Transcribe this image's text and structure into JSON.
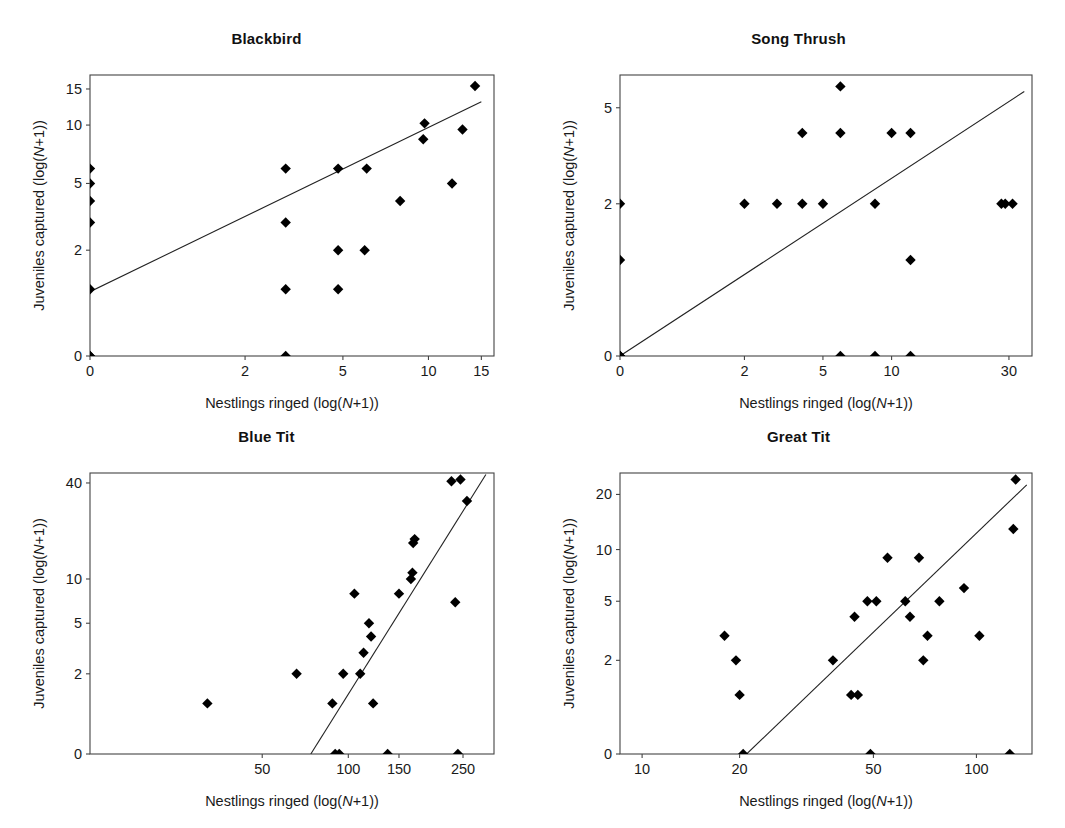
{
  "figure": {
    "background": "#ffffff",
    "marker_color": "#000000",
    "line_color": "#222222",
    "axis_color": "#444444",
    "panel_count": 4
  },
  "axis_labels": {
    "x_prefix": "Nestlings ringed (log(",
    "x_italic": "N",
    "x_suffix": "+1))",
    "y_prefix": "Juveniles captured (log(",
    "y_italic": "N",
    "y_suffix": "+1))"
  },
  "chart_data": [
    {
      "type": "scatter",
      "title": "Blackbird",
      "xlabel": "Nestlings ringed (log(N+1))",
      "ylabel": "Juveniles captured (log(N+1))",
      "grid": false,
      "legend": "none",
      "x_scale": "log1p",
      "y_scale": "log1p",
      "x_ticks": [
        0,
        2,
        5,
        10,
        15
      ],
      "x_tick_labels": [
        "0",
        "2",
        "5",
        "10",
        "15"
      ],
      "y_ticks": [
        0,
        2,
        5,
        10,
        15
      ],
      "y_tick_labels": [
        "0",
        "2",
        "5",
        "10",
        "15"
      ],
      "xlim": [
        0,
        16.5
      ],
      "ylim": [
        0,
        17.5
      ],
      "points": [
        {
          "x": 0,
          "y": 0
        },
        {
          "x": 0,
          "y": 0
        },
        {
          "x": 0,
          "y": 1
        },
        {
          "x": 0,
          "y": 3
        },
        {
          "x": 0,
          "y": 4
        },
        {
          "x": 0,
          "y": 5
        },
        {
          "x": 0,
          "y": 6
        },
        {
          "x": 3,
          "y": 0
        },
        {
          "x": 3,
          "y": 1
        },
        {
          "x": 3,
          "y": 3
        },
        {
          "x": 3,
          "y": 6
        },
        {
          "x": 4.8,
          "y": 1
        },
        {
          "x": 4.8,
          "y": 2
        },
        {
          "x": 4.8,
          "y": 6
        },
        {
          "x": 6,
          "y": 2
        },
        {
          "x": 6.1,
          "y": 6
        },
        {
          "x": 8,
          "y": 4
        },
        {
          "x": 9.6,
          "y": 8.5
        },
        {
          "x": 9.7,
          "y": 10.2
        },
        {
          "x": 12,
          "y": 5
        },
        {
          "x": 13,
          "y": 9.5
        },
        {
          "x": 14.3,
          "y": 15.5
        }
      ],
      "fit_line": {
        "x1": 0,
        "y1": 0.95,
        "x2": 15.0,
        "y2": 13.0
      }
    },
    {
      "type": "scatter",
      "title": "Song Thrush",
      "xlabel": "Nestlings ringed (log(N+1))",
      "ylabel": "Juveniles captured (log(N+1))",
      "grid": false,
      "legend": "none",
      "x_scale": "log1p",
      "y_scale": "log1p",
      "x_ticks": [
        0,
        2,
        5,
        10,
        30
      ],
      "x_tick_labels": [
        "0",
        "2",
        "5",
        "10",
        "30"
      ],
      "y_ticks": [
        0,
        2,
        5
      ],
      "y_tick_labels": [
        "0",
        "2",
        "5"
      ],
      "xlim": [
        0,
        37
      ],
      "ylim": [
        0,
        6.6
      ],
      "points": [
        {
          "x": 0,
          "y": 0
        },
        {
          "x": 0,
          "y": 0
        },
        {
          "x": 0,
          "y": 0
        },
        {
          "x": 0,
          "y": 1
        },
        {
          "x": 0,
          "y": 2
        },
        {
          "x": 2,
          "y": 2
        },
        {
          "x": 3,
          "y": 2
        },
        {
          "x": 4,
          "y": 2
        },
        {
          "x": 4,
          "y": 4
        },
        {
          "x": 5,
          "y": 2
        },
        {
          "x": 6,
          "y": 0
        },
        {
          "x": 6,
          "y": 4
        },
        {
          "x": 6,
          "y": 6
        },
        {
          "x": 8.5,
          "y": 0
        },
        {
          "x": 8.5,
          "y": 2
        },
        {
          "x": 10,
          "y": 4
        },
        {
          "x": 12,
          "y": 0
        },
        {
          "x": 12,
          "y": 1
        },
        {
          "x": 12,
          "y": 4
        },
        {
          "x": 28,
          "y": 2
        },
        {
          "x": 29,
          "y": 2
        },
        {
          "x": 31,
          "y": 2
        }
      ],
      "fit_line": {
        "x1": 0,
        "y1": 0,
        "x2": 34.5,
        "y2": 5.75
      }
    },
    {
      "type": "scatter",
      "title": "Blue Tit",
      "xlabel": "Nestlings ringed (log(N+1))",
      "ylabel": "Juveniles captured (log(N+1))",
      "grid": false,
      "legend": "none",
      "x_scale": "log1p",
      "y_scale": "log1p",
      "x_ticks": [
        50,
        100,
        150,
        250
      ],
      "x_tick_labels": [
        "50",
        "100",
        "150",
        "250"
      ],
      "y_ticks": [
        0,
        2,
        5,
        10,
        40
      ],
      "y_tick_labels": [
        "0",
        "2",
        "5",
        "10",
        "40"
      ],
      "xlim": [
        12,
        320
      ],
      "ylim": [
        0,
        46
      ],
      "points": [
        {
          "x": 32,
          "y": 1
        },
        {
          "x": 66,
          "y": 2
        },
        {
          "x": 88,
          "y": 1
        },
        {
          "x": 90,
          "y": 0
        },
        {
          "x": 93,
          "y": 0
        },
        {
          "x": 96,
          "y": 2
        },
        {
          "x": 105,
          "y": 8
        },
        {
          "x": 110,
          "y": 2
        },
        {
          "x": 113,
          "y": 3
        },
        {
          "x": 118,
          "y": 5
        },
        {
          "x": 120,
          "y": 4
        },
        {
          "x": 122,
          "y": 1
        },
        {
          "x": 137,
          "y": 0
        },
        {
          "x": 150,
          "y": 8
        },
        {
          "x": 165,
          "y": 10
        },
        {
          "x": 167,
          "y": 11
        },
        {
          "x": 168,
          "y": 17
        },
        {
          "x": 170,
          "y": 18
        },
        {
          "x": 228,
          "y": 41
        },
        {
          "x": 235,
          "y": 7
        },
        {
          "x": 240,
          "y": 0
        },
        {
          "x": 245,
          "y": 42
        },
        {
          "x": 258,
          "y": 31
        }
      ],
      "fit_line": {
        "x1": 74,
        "y1": 0,
        "x2": 300,
        "y2": 45
      }
    },
    {
      "type": "scatter",
      "title": "Great Tit",
      "xlabel": "Nestlings ringed (log(N+1))",
      "ylabel": "Juveniles captured (log(N+1))",
      "grid": false,
      "legend": "none",
      "x_scale": "log1p",
      "y_scale": "log1p",
      "x_ticks": [
        10,
        20,
        50,
        100
      ],
      "x_tick_labels": [
        "10",
        "20",
        "50",
        "100"
      ],
      "y_ticks": [
        0,
        2,
        5,
        10,
        20
      ],
      "y_tick_labels": [
        "0",
        "2",
        "5",
        "10",
        "20"
      ],
      "xlim": [
        8.5,
        145
      ],
      "ylim": [
        0,
        26
      ],
      "points": [
        {
          "x": 18,
          "y": 3
        },
        {
          "x": 19.5,
          "y": 2
        },
        {
          "x": 20.5,
          "y": 0
        },
        {
          "x": 20,
          "y": 1
        },
        {
          "x": 38,
          "y": 2
        },
        {
          "x": 43,
          "y": 1
        },
        {
          "x": 45,
          "y": 1
        },
        {
          "x": 44,
          "y": 4
        },
        {
          "x": 49,
          "y": 0
        },
        {
          "x": 48,
          "y": 5
        },
        {
          "x": 51,
          "y": 5
        },
        {
          "x": 55,
          "y": 9
        },
        {
          "x": 62,
          "y": 5
        },
        {
          "x": 64,
          "y": 4
        },
        {
          "x": 68,
          "y": 9
        },
        {
          "x": 70,
          "y": 2
        },
        {
          "x": 72,
          "y": 3
        },
        {
          "x": 78,
          "y": 5
        },
        {
          "x": 92,
          "y": 6
        },
        {
          "x": 102,
          "y": 3
        },
        {
          "x": 125,
          "y": 0
        },
        {
          "x": 128,
          "y": 13
        },
        {
          "x": 130,
          "y": 24
        }
      ],
      "fit_line": {
        "x1": 21,
        "y1": 0,
        "x2": 140,
        "y2": 22.5
      }
    }
  ]
}
